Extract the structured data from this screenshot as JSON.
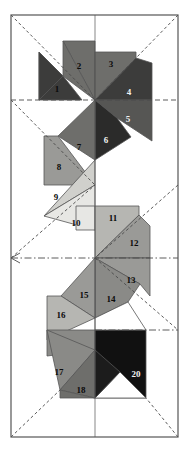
{
  "figure": {
    "title": "",
    "width": 188,
    "height": 457,
    "background": "#ffffff",
    "frame": {
      "name": "outer-rectangle",
      "x": 11,
      "y": 15,
      "width": 167,
      "height": 422,
      "stroke": "#555555",
      "stroke_width": 1.2,
      "fill": "none"
    },
    "palette": {
      "white": "#ffffff",
      "very_light_gray": "#e7e7e4",
      "light_gray": "#d0d0cc",
      "mid_light_gray": "#b6b6b2",
      "mid_gray": "#9a9a97",
      "gray": "#8a8a87",
      "dark_gray": "#6e6e6b",
      "darker_gray": "#565654",
      "very_dark_gray": "#3c3c3b",
      "near_black": "#1c1c1c",
      "black": "#111111",
      "outline": "#555555",
      "label_color": "#0a0a0a",
      "dash_color": "#4a4a4a"
    },
    "centers": [
      {
        "name": "rosette-center-top",
        "x": 95,
        "y": 100
      },
      {
        "name": "rosette-center-middle",
        "x": 95,
        "y": 258
      },
      {
        "name": "rosette-center-bottom",
        "x": 95,
        "y": 350
      }
    ],
    "construction_lines": [
      {
        "name": "dash-diag-a",
        "x1": 11,
        "y1": 15,
        "x2": 95,
        "y2": 100,
        "style": "dashed"
      },
      {
        "name": "dash-diag-b",
        "x1": 178,
        "y1": 15,
        "x2": 95,
        "y2": 100,
        "style": "dashed"
      },
      {
        "name": "dash-horiz-top",
        "x1": 11,
        "y1": 100,
        "x2": 178,
        "y2": 100,
        "style": "dashed"
      },
      {
        "name": "dash-diag-c",
        "x1": 11,
        "y1": 100,
        "x2": 95,
        "y2": 185,
        "style": "dashed"
      },
      {
        "name": "dash-horiz-mid",
        "x1": 11,
        "y1": 258,
        "x2": 178,
        "y2": 258,
        "style": "dashdot"
      },
      {
        "name": "dash-diag-d",
        "x1": 11,
        "y1": 258,
        "x2": 95,
        "y2": 185,
        "style": "dashed"
      },
      {
        "name": "dash-diag-e",
        "x1": 178,
        "y1": 185,
        "x2": 95,
        "y2": 258,
        "style": "dashed"
      },
      {
        "name": "dash-diag-f",
        "x1": 95,
        "y1": 258,
        "x2": 178,
        "y2": 330,
        "style": "dashed"
      },
      {
        "name": "dash-horiz-bot",
        "x1": 95,
        "y1": 330,
        "x2": 178,
        "y2": 330,
        "style": "dashdot"
      },
      {
        "name": "dash-diag-g",
        "x1": 11,
        "y1": 437,
        "x2": 60,
        "y2": 390,
        "style": "dashed"
      },
      {
        "name": "dash-diag-h",
        "x1": 178,
        "y1": 437,
        "x2": 140,
        "y2": 398,
        "style": "dashed"
      },
      {
        "name": "vline-center",
        "x1": 95,
        "y1": 15,
        "x2": 95,
        "y2": 437,
        "style": "solid-thin"
      }
    ],
    "tiles": [
      {
        "id": 1,
        "label": "1",
        "fill": "#3c3c3b",
        "label_x": 57,
        "label_y": 92,
        "points": "39,52 39,100 82,100 82,100 63,76"
      },
      {
        "id": 2,
        "label": "2",
        "fill": "#6e6e6b",
        "label_x": 79,
        "label_y": 69,
        "points": "63,41 95,100 95,41 95,41"
      },
      {
        "id": 3,
        "label": "3",
        "fill": "#6e6e6b",
        "label_x": 111,
        "label_y": 67,
        "points": "95,52 95,100 136,58 136,52"
      },
      {
        "id": 4,
        "label": "4",
        "fill": "#3c3c3b",
        "label_x": 129,
        "label_y": 95,
        "points": "95,100 152,100 152,63 136,79"
      },
      {
        "id": 5,
        "label": "5",
        "fill": "#565654",
        "label_x": 128,
        "label_y": 122,
        "points": "95,100 152,100 152,141 117,118"
      },
      {
        "id": 6,
        "label": "6",
        "fill": "#2b2b2a",
        "label_x": 106,
        "label_y": 143,
        "points": "95,100 95,160 131,137 117,118"
      },
      {
        "id": 7,
        "label": "7",
        "fill": "#6e6e6b",
        "label_x": 79,
        "label_y": 150,
        "points": "95,100 95,160 58,136 58,136"
      },
      {
        "id": 8,
        "label": "8",
        "fill": "#9a9a97",
        "label_x": 59,
        "label_y": 170,
        "points": "44,136 44,185 95,185 58,136"
      },
      {
        "id": 9,
        "label": "9",
        "fill": "#d0d0cc",
        "label_x": 56,
        "label_y": 200,
        "points": "95,160 95,185 44,216 44,196"
      },
      {
        "id": 10,
        "label": "10",
        "fill": "#e7e7e4",
        "label_x": 76,
        "label_y": 226,
        "points": "95,185 95,230 44,216 44,216"
      },
      {
        "id": 11,
        "label": "11",
        "fill": "#b6b6b2",
        "label_x": 113,
        "label_y": 221,
        "points": "95,206 95,258 139,215 139,206"
      },
      {
        "id": 12,
        "label": "12",
        "fill": "#9a9a97",
        "label_x": 134,
        "label_y": 246,
        "points": "95,258 150,258 150,226 139,236"
      },
      {
        "id": 13,
        "label": "13",
        "fill": "#9a9a97",
        "label_x": 131,
        "label_y": 283,
        "points": "95,258 150,258 150,296 140,284"
      },
      {
        "id": 14,
        "label": "14",
        "fill": "#8a8a87",
        "label_x": 111,
        "label_y": 302,
        "points": "95,258 95,318 128,302 128,296"
      },
      {
        "id": 15,
        "label": "15",
        "fill": "#9a9a97",
        "label_x": 84,
        "label_y": 298,
        "points": "95,258 95,318 61,296 61,296"
      },
      {
        "id": 16,
        "label": "16",
        "fill": "#b6b6b2",
        "label_x": 61,
        "label_y": 318,
        "points": "47,296 47,340 95,318 61,296"
      },
      {
        "id": 17,
        "label": "17",
        "fill": "#8a8a87",
        "label_x": 59,
        "label_y": 375,
        "points": "95,350 95,330 47,330 47,352"
      },
      {
        "id": 18,
        "label": "18",
        "fill": "#6e6e6b",
        "label_x": 81,
        "label_y": 393,
        "points": "95,350 95,398 47,390 47,382"
      },
      {
        "id": 20,
        "label": "20",
        "fill": "#111111",
        "label_x": 136,
        "label_y": 377,
        "points": "95,350 95,398 146,398 146,350"
      }
    ],
    "label_font_size": 9,
    "label_color": "#0a0a0a"
  }
}
